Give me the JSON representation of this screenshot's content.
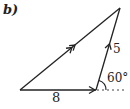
{
  "diagram": {
    "part_label": "b)",
    "type": "vector triangle",
    "vertices": {
      "A": [
        20,
        90
      ],
      "B": [
        96,
        90
      ],
      "C": [
        120,
        8
      ]
    },
    "edges": [
      {
        "from": "A",
        "to": "B",
        "label": "8",
        "arrow": "single",
        "direction": "A→B"
      },
      {
        "from": "B",
        "to": "C",
        "label": "5",
        "arrow": "single",
        "direction": "B→C"
      },
      {
        "from": "A",
        "to": "C",
        "label": "",
        "arrow": "double",
        "direction": "A→C"
      }
    ],
    "labels": {
      "base_length": "8",
      "side_length": "5",
      "angle": "60°"
    },
    "colors": {
      "line": "#222222",
      "background": "#ffffff"
    }
  }
}
